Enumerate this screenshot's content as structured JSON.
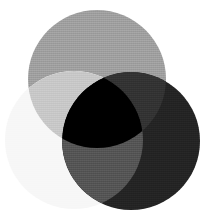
{
  "figure": {
    "background_color": "#ffffff",
    "width": 206,
    "height": 223
  },
  "chart_data": {
    "type": "venn",
    "subtitle": "",
    "xlabel": "",
    "ylabel": "",
    "grid": false,
    "legend_position": "none",
    "blend_mode": "multiply",
    "background_color": "#ffffff",
    "texture": "dithered",
    "sets": [
      {
        "name": "top",
        "label": "",
        "cx": 97,
        "cy": 79,
        "r": 69,
        "color": "#a0a0a0",
        "opacity": 1
      },
      {
        "name": "left",
        "label": "",
        "cx": 74,
        "cy": 140,
        "r": 69,
        "color": "#f7f7f7",
        "opacity": 1
      },
      {
        "name": "right",
        "label": "",
        "cx": 131,
        "cy": 141,
        "r": 69,
        "color": "#242424",
        "opacity": 1
      }
    ],
    "regions": [
      {
        "name": "top-only",
        "members": [
          "top"
        ],
        "color": "#a0a0a0"
      },
      {
        "name": "left-only",
        "members": [
          "left"
        ],
        "color": "#f7f7f7"
      },
      {
        "name": "right-only",
        "members": [
          "right"
        ],
        "color": "#242424"
      },
      {
        "name": "top-left",
        "members": [
          "top",
          "left"
        ],
        "color": "#c8c8c8"
      },
      {
        "name": "top-right",
        "members": [
          "top",
          "right"
        ],
        "color": "#333333"
      },
      {
        "name": "left-right",
        "members": [
          "left",
          "right"
        ],
        "color": "#555555"
      },
      {
        "name": "top-left-right",
        "members": [
          "top",
          "left",
          "right"
        ],
        "color": "#000000"
      }
    ]
  }
}
